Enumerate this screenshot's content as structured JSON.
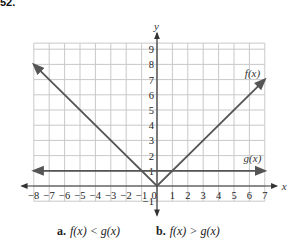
{
  "problem": {
    "number": "52."
  },
  "chart_data": {
    "type": "line",
    "title": "",
    "xlabel": "x",
    "ylabel": "y",
    "xlim": [
      -8,
      7
    ],
    "ylim": [
      -1,
      9.4
    ],
    "grid": true,
    "x_ticks": [
      -8,
      -7,
      -6,
      -5,
      -4,
      -3,
      -2,
      -1,
      0,
      1,
      2,
      3,
      4,
      5,
      6,
      7
    ],
    "y_ticks": [
      -1,
      1,
      2,
      3,
      4,
      5,
      6,
      7,
      8,
      9
    ],
    "series": [
      {
        "name": "f(x)",
        "formula": "|x|",
        "x": [
          -8,
          0,
          7
        ],
        "y": [
          8,
          0,
          7
        ],
        "color": "#555555"
      },
      {
        "name": "g(x)",
        "formula": "1",
        "x": [
          -8,
          7
        ],
        "y": [
          1,
          1
        ],
        "color": "#555555"
      }
    ],
    "annotations": [
      {
        "text": "f(x)",
        "x": 6.2,
        "y": 7.2
      },
      {
        "text": "g(x)",
        "x": 6.2,
        "y": 1.6
      }
    ]
  },
  "labels": {
    "x_axis": "x",
    "y_axis": "y",
    "f": "f(x)",
    "g": "g(x)"
  },
  "questions": [
    {
      "letter": "a.",
      "expr": "f(x) < g(x)"
    },
    {
      "letter": "b.",
      "expr": "f(x) > g(x)"
    }
  ]
}
